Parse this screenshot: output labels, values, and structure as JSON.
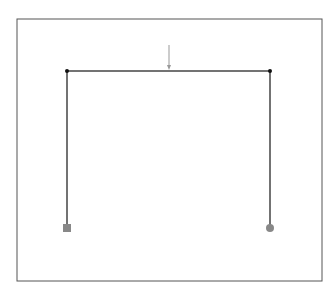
{
  "diagram": {
    "type": "portal-frame",
    "border": {
      "x": 17,
      "y": 19,
      "width": 305,
      "height": 262,
      "color": "#555555"
    },
    "frame": {
      "color": "#444444",
      "nodes": [
        {
          "id": "top-left",
          "x": 67,
          "y": 71
        },
        {
          "id": "top-right",
          "x": 270,
          "y": 71
        },
        {
          "id": "base-left",
          "x": 67,
          "y": 228
        },
        {
          "id": "base-right",
          "x": 270,
          "y": 228
        }
      ],
      "members": [
        {
          "name": "left-column",
          "from": "base-left",
          "to": "top-left"
        },
        {
          "name": "beam",
          "from": "top-left",
          "to": "top-right"
        },
        {
          "name": "right-column",
          "from": "top-right",
          "to": "base-right"
        }
      ]
    },
    "supports": [
      {
        "name": "fixed-support",
        "shape": "square",
        "x": 67,
        "y": 228,
        "color": "#888888"
      },
      {
        "name": "pinned-support",
        "shape": "circle",
        "x": 270,
        "y": 228,
        "color": "#888888"
      }
    ],
    "load": {
      "name": "point-load",
      "x": 169,
      "y_start": 45,
      "y_end": 70,
      "color": "#999999"
    }
  }
}
